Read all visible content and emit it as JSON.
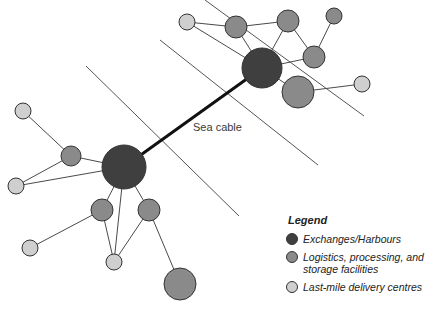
{
  "diagram": {
    "cable_label": "Sea cable",
    "colors": {
      "exchange": "#3f3f3f",
      "logistics": "#8a8a8a",
      "lastmile": "#cfcfcf",
      "stroke": "#4a4a4a",
      "cable": "#111111"
    },
    "coastlines": [
      {
        "x1": 86,
        "y1": 66,
        "x2": 239,
        "y2": 216
      },
      {
        "x1": 160,
        "y1": 40,
        "x2": 318,
        "y2": 165
      },
      {
        "x1": 205,
        "y1": 0,
        "x2": 364,
        "y2": 116
      }
    ],
    "sea_cable": {
      "x1": 124,
      "y1": 167,
      "x2": 262,
      "y2": 68
    },
    "nodes": [
      {
        "id": "L-hub",
        "type": "exchange",
        "x": 124,
        "y": 167,
        "r": 22
      },
      {
        "id": "L1",
        "type": "logistics",
        "x": 71,
        "y": 156,
        "r": 10
      },
      {
        "id": "L2",
        "type": "lastmile",
        "x": 23,
        "y": 111,
        "r": 8
      },
      {
        "id": "L3",
        "type": "lastmile",
        "x": 16,
        "y": 186,
        "r": 8
      },
      {
        "id": "L4",
        "type": "logistics",
        "x": 102,
        "y": 210,
        "r": 11
      },
      {
        "id": "L5",
        "type": "logistics",
        "x": 149,
        "y": 210,
        "r": 11
      },
      {
        "id": "L6",
        "type": "lastmile",
        "x": 30,
        "y": 248,
        "r": 8
      },
      {
        "id": "L7",
        "type": "lastmile",
        "x": 114,
        "y": 262,
        "r": 8
      },
      {
        "id": "L8",
        "type": "logistics",
        "x": 180,
        "y": 284,
        "r": 16
      },
      {
        "id": "R-hub",
        "type": "exchange",
        "x": 262,
        "y": 68,
        "r": 20
      },
      {
        "id": "R1",
        "type": "lastmile",
        "x": 187,
        "y": 22,
        "r": 8
      },
      {
        "id": "R2",
        "type": "logistics",
        "x": 236,
        "y": 27,
        "r": 11
      },
      {
        "id": "R3",
        "type": "logistics",
        "x": 288,
        "y": 21,
        "r": 11
      },
      {
        "id": "R4",
        "type": "logistics",
        "x": 334,
        "y": 16,
        "r": 8
      },
      {
        "id": "R5",
        "type": "logistics",
        "x": 314,
        "y": 57,
        "r": 11
      },
      {
        "id": "R6",
        "type": "logistics",
        "x": 298,
        "y": 92,
        "r": 16
      },
      {
        "id": "R7",
        "type": "lastmile",
        "x": 362,
        "y": 84,
        "r": 8
      }
    ],
    "edges": [
      [
        "L-hub",
        "L1"
      ],
      [
        "L-hub",
        "L3"
      ],
      [
        "L1",
        "L2"
      ],
      [
        "L1",
        "L3"
      ],
      [
        "L-hub",
        "L4"
      ],
      [
        "L-hub",
        "L5"
      ],
      [
        "L-hub",
        "L7"
      ],
      [
        "L4",
        "L6"
      ],
      [
        "L4",
        "L7"
      ],
      [
        "L5",
        "L7"
      ],
      [
        "L5",
        "L8"
      ],
      [
        "R-hub",
        "R1"
      ],
      [
        "R-hub",
        "R2"
      ],
      [
        "R1",
        "R2"
      ],
      [
        "R2",
        "R3"
      ],
      [
        "R-hub",
        "R3"
      ],
      [
        "R3",
        "R5"
      ],
      [
        "R5",
        "R4"
      ],
      [
        "R5",
        "R-hub"
      ],
      [
        "R-hub",
        "R6"
      ],
      [
        "R6",
        "R7"
      ]
    ]
  },
  "legend": {
    "title": "Legend",
    "items": [
      {
        "label": "Exchanges/Harbours",
        "color": "#3f3f3f"
      },
      {
        "label": "Logistics, processing, and storage facilities",
        "color": "#8a8a8a"
      },
      {
        "label": "Last-mile delivery centres",
        "color": "#cfcfcf"
      }
    ]
  }
}
